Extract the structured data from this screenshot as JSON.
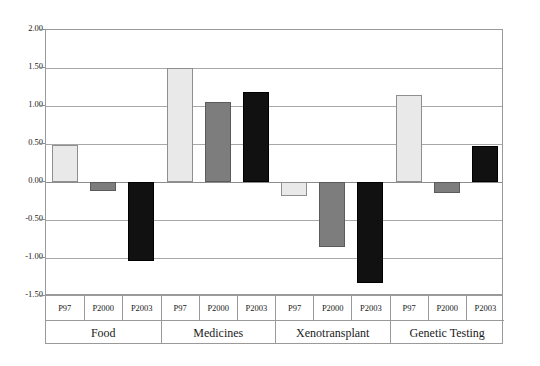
{
  "chart_data": {
    "type": "bar",
    "title": "",
    "subtitle": "",
    "xlabel": "",
    "ylabel": "",
    "ylim": [
      -1.5,
      2.0
    ],
    "yticks": [
      "2.00",
      "1.50",
      "1.00",
      "0.50",
      "0.00",
      "-0.50",
      "-1.00",
      "-1.50"
    ],
    "ytick_values": [
      2.0,
      1.5,
      1.0,
      0.5,
      0.0,
      -0.5,
      -1.0,
      -1.5
    ],
    "grid": true,
    "legend": "none",
    "categories": [
      "Food",
      "Medicines",
      "Xenotransplant",
      "Genetic Testing"
    ],
    "series_labels": [
      "P97",
      "P2000",
      "P2003"
    ],
    "series": [
      {
        "name": "P97",
        "color": "#e9e9e9",
        "values": [
          0.49,
          1.5,
          -0.19,
          1.14
        ]
      },
      {
        "name": "P2000",
        "color": "#7d7d7d",
        "values": [
          -0.12,
          1.05,
          -0.85,
          -0.14
        ]
      },
      {
        "name": "P2003",
        "color": "#111111",
        "values": [
          -1.04,
          1.18,
          -1.33,
          0.48
        ]
      }
    ]
  },
  "axis_table": {
    "groups": [
      {
        "label": "Food",
        "series": [
          "P97",
          "P2000",
          "P2003"
        ]
      },
      {
        "label": "Medicines",
        "series": [
          "P97",
          "P2000",
          "P2003"
        ]
      },
      {
        "label": "Xenotransplant",
        "series": [
          "P97",
          "P2000",
          "P2003"
        ]
      },
      {
        "label": "Genetic Testing",
        "series": [
          "P97",
          "P2000",
          "P2003"
        ]
      }
    ]
  },
  "colors": {
    "series_p97": "#e9e9e9",
    "series_p2000": "#7d7d7d",
    "series_p2003": "#111111",
    "gridline": "#a8a8a8",
    "frame": "#9a9a9a",
    "text": "#1a1a1a",
    "background": "#ffffff"
  }
}
